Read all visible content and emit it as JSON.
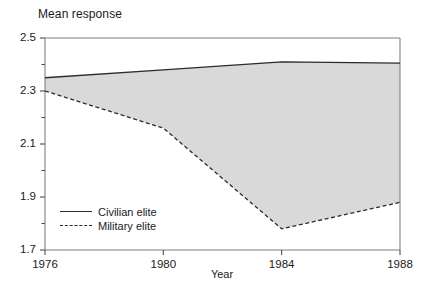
{
  "chart_data": {
    "type": "line",
    "title": "",
    "ylabel": "Mean response",
    "xlabel": "Year",
    "x": [
      1976,
      1980,
      1984,
      1988
    ],
    "xtick_labels": [
      "1976",
      "1980",
      "1984",
      "1988"
    ],
    "ytick_labels": [
      "2.5",
      "2.3",
      "2.1",
      "1.9",
      "1.7"
    ],
    "ytick_values": [
      2.5,
      2.3,
      2.1,
      1.9,
      1.7
    ],
    "yminor_values": [
      2.4,
      2.2,
      2.0,
      1.8
    ],
    "xlim": [
      1976,
      1988
    ],
    "ylim": [
      1.7,
      2.5
    ],
    "grid": false,
    "legend_position": "bottom-left",
    "fill_between_series": [
      "Civilian elite",
      "Military elite"
    ],
    "fill_color": "#d9d9d9",
    "line_color": "#2b2b2b",
    "series": [
      {
        "name": "Civilian elite",
        "style": "solid",
        "values": [
          2.35,
          2.38,
          2.41,
          2.405
        ]
      },
      {
        "name": "Military elite",
        "style": "dashed",
        "values": [
          2.3,
          2.16,
          1.78,
          1.88
        ]
      }
    ]
  },
  "axes": {
    "y_title": "Mean response",
    "x_title": "Year"
  },
  "legend": {
    "items": [
      {
        "label": "Civilian elite",
        "style": "solid"
      },
      {
        "label": "Military elite",
        "style": "dashed"
      }
    ]
  }
}
